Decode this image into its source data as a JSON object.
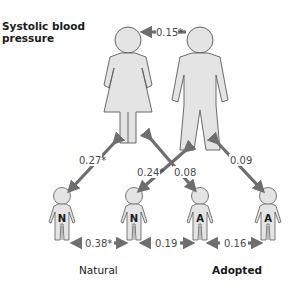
{
  "title": "Systolic blood pressure",
  "title_lines": [
    "Systolic blood",
    "pressure"
  ],
  "colors": {
    "figure_fill": "#e4e4e4",
    "figure_stroke": "#5a5a5a",
    "arrow": "#6e6e6e",
    "text": "#1a1a1a",
    "coef_text": "#4a4a4a"
  },
  "parents": {
    "mother": {
      "label": "mother"
    },
    "father": {
      "label": "father"
    }
  },
  "children": [
    {
      "letter": "N",
      "type": "natural"
    },
    {
      "letter": "N",
      "type": "natural"
    },
    {
      "letter": "A",
      "type": "adopted"
    },
    {
      "letter": "A",
      "type": "adopted"
    }
  ],
  "correlations": {
    "mother_father": "0.15*",
    "mother_natural": "0.27*",
    "father_natural": "0.24*",
    "mother_adopted": "0.08",
    "father_adopted": "0.09",
    "natural_natural": "0.38*",
    "natural_adopted": "0.19",
    "adopted_adopted": "0.16"
  },
  "group_labels": {
    "natural": "Natural",
    "adopted": "Adopted"
  }
}
